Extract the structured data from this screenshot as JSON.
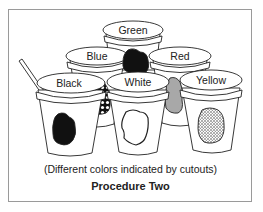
{
  "figure": {
    "caption_note": "(Different colors indicated by cutouts)",
    "caption_title": "Procedure Two"
  },
  "cups": [
    {
      "label": "Green",
      "cutout": "black solid",
      "row": "back"
    },
    {
      "label": "Blue",
      "cutout": "dotted pattern (circles)",
      "row": "middle"
    },
    {
      "label": "Red",
      "cutout": "gray fill",
      "row": "middle"
    },
    {
      "label": "Black",
      "cutout": "black solid",
      "row": "front",
      "has_straw": true
    },
    {
      "label": "White",
      "cutout": "white (outline only)",
      "row": "front"
    },
    {
      "label": "Yellow",
      "cutout": "stippled pattern",
      "row": "front"
    }
  ],
  "colors": {
    "border": "#9a9a9a",
    "line": "#222222",
    "gray_cutout": "#a8a8a8",
    "black_cutout": "#111111"
  }
}
